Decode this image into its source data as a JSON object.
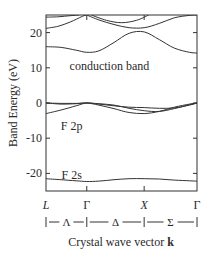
{
  "chart_data": {
    "type": "line",
    "title": "",
    "xlabel": "Crystal wave vector k",
    "xlabel_plain": "Crystal wave vector ",
    "xlabel_bold": "k",
    "ylabel": "Band Energy (eV)",
    "ylim": [
      -25,
      25
    ],
    "yticks": [
      20,
      10,
      0,
      -10,
      -20
    ],
    "ytick_labels": [
      "20",
      "10",
      "0",
      "-10",
      "-20"
    ],
    "grid": false,
    "legend": null,
    "k_points": [
      {
        "label": "L",
        "x": 0.0,
        "italic": true
      },
      {
        "label": "Γ",
        "x": 0.27,
        "italic": false
      },
      {
        "label": "X",
        "x": 0.65,
        "italic": true
      },
      {
        "label": "Γ",
        "x": 1.0,
        "italic": false
      }
    ],
    "k_directions": [
      {
        "label": "Λ",
        "from": 0.0,
        "to": 0.27
      },
      {
        "label": "Δ",
        "from": 0.27,
        "to": 0.65
      },
      {
        "label": "Σ",
        "from": 0.65,
        "to": 1.0
      }
    ],
    "annotations": [
      {
        "text": "conduction band",
        "x": 0.42,
        "y": 10.5
      },
      {
        "text": "F 2p",
        "x": 0.17,
        "y": -6.5
      },
      {
        "text": "F 2s",
        "x": 0.17,
        "y": -20.5
      }
    ],
    "series": [
      {
        "name": "F 2s",
        "x": [
          0.0,
          0.1,
          0.2,
          0.27,
          0.35,
          0.45,
          0.55,
          0.65,
          0.75,
          0.85,
          0.95,
          1.0
        ],
        "y": [
          -21.5,
          -21.8,
          -22.1,
          -22.3,
          -22.2,
          -21.8,
          -21.5,
          -21.5,
          -21.6,
          -21.9,
          -22.1,
          -22.2
        ]
      },
      {
        "name": "F 2p-1",
        "x": [
          0.0,
          0.1,
          0.2,
          0.27,
          0.35,
          0.45,
          0.55,
          0.65,
          0.75,
          0.85,
          0.95,
          1.0
        ],
        "y": [
          0.0,
          -0.3,
          -0.2,
          0.0,
          -0.6,
          -1.6,
          -2.7,
          -3.0,
          -2.4,
          -1.2,
          -0.3,
          0.0
        ]
      },
      {
        "name": "F 2p-2",
        "x": [
          0.0,
          0.1,
          0.2,
          0.27,
          0.35,
          0.45,
          0.55,
          0.65,
          0.75,
          0.85,
          0.95,
          1.0
        ],
        "y": [
          -3.0,
          -2.0,
          -0.8,
          0.0,
          -0.3,
          -0.8,
          -1.2,
          -1.3,
          -1.5,
          -1.4,
          -0.6,
          0.0
        ]
      },
      {
        "name": "F 2p-3",
        "x": [
          0.0,
          0.1,
          0.2,
          0.27,
          0.35,
          0.45,
          0.55,
          0.65,
          0.75,
          0.85,
          0.95,
          1.0
        ],
        "y": [
          0.0,
          -0.1,
          -0.1,
          0.0,
          -0.2,
          -0.6,
          -1.5,
          -2.2,
          -2.4,
          -1.6,
          -0.5,
          0.0
        ]
      },
      {
        "name": "conduction-1",
        "x": [
          0.0,
          0.1,
          0.2,
          0.27,
          0.35,
          0.45,
          0.55,
          0.65,
          0.75,
          0.85,
          0.95,
          1.0
        ],
        "y": [
          16.0,
          15.8,
          15.0,
          14.4,
          14.8,
          17.2,
          19.8,
          20.2,
          18.0,
          15.6,
          14.4,
          14.2
        ]
      },
      {
        "name": "conduction-2",
        "x": [
          0.0,
          0.08,
          0.16,
          0.24,
          0.27
        ],
        "y": [
          21.2,
          21.8,
          23.0,
          24.6,
          25.0
        ]
      },
      {
        "name": "conduction-3",
        "x": [
          0.0,
          0.08,
          0.16,
          0.22
        ],
        "y": [
          24.4,
          24.5,
          24.8,
          25.0
        ]
      },
      {
        "name": "conduction-4",
        "x": [
          0.27,
          0.35,
          0.45,
          0.55,
          0.65,
          0.75,
          0.85,
          0.95,
          1.0
        ],
        "y": [
          25.0,
          23.6,
          22.3,
          21.4,
          21.4,
          22.6,
          24.2,
          24.9,
          25.0
        ]
      },
      {
        "name": "conduction-5",
        "x": [
          0.3,
          0.4,
          0.5,
          0.6,
          0.68
        ],
        "y": [
          25.0,
          23.5,
          22.8,
          23.5,
          25.0
        ]
      }
    ]
  }
}
